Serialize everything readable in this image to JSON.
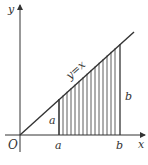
{
  "diagram": {
    "type": "coordinate-plane-area",
    "axes": {
      "x_label": "x",
      "y_label": "y",
      "origin_label": "O"
    },
    "line": {
      "equation_label": "y=x"
    },
    "x_ticks": [
      {
        "label": "a"
      },
      {
        "label": "b"
      }
    ],
    "segment_labels": [
      {
        "label": "a",
        "describes": "height at x=a"
      },
      {
        "label": "b",
        "describes": "height at x=b"
      }
    ],
    "shaded_region": {
      "description": "trapezoid under y=x between x=a and x=b, vertical hatching",
      "hatch_lines": 16
    },
    "colors": {
      "stroke": "#333333",
      "background": "#ffffff"
    }
  }
}
